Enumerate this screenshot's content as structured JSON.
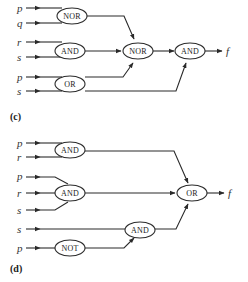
{
  "diagram_c": {
    "caption": "(c)",
    "inputs": [
      "p",
      "q",
      "r",
      "s",
      "p",
      "s"
    ],
    "gates": {
      "g1": "NOR",
      "g2": "AND",
      "g3": "OR",
      "g4": "NOR",
      "g5": "AND"
    },
    "output": "f"
  },
  "diagram_d": {
    "caption": "(d)",
    "inputs": [
      "p",
      "r",
      "p",
      "r",
      "s",
      "s",
      "p"
    ],
    "gates": {
      "g1": "AND",
      "g2": "AND",
      "g3": "NOT",
      "g4": "AND",
      "g5": "OR"
    },
    "output": "f"
  }
}
